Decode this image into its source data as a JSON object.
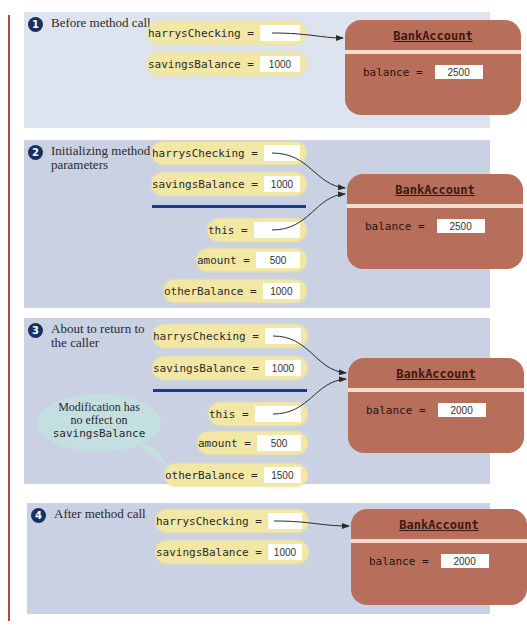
{
  "class_name": "BankAccount",
  "colors": {
    "panel_bg": "#c9d1e2",
    "panel1_bg": "#dde3ef",
    "variable_bg": "#f3e7a6",
    "object_bg": "#b76e5a",
    "divider": "#1a3a8a",
    "step_badge": "#17305f",
    "note_bubble": "#c4dfe0",
    "margin_rule": "#b5473e"
  },
  "steps": [
    {
      "number": "1",
      "caption": "Before method call",
      "variables": [
        {
          "name": "harrysChecking =",
          "value": ""
        },
        {
          "name": "savingsBalance =",
          "value": "1000"
        }
      ],
      "object": {
        "field": "balance =",
        "value": "2500"
      }
    },
    {
      "number": "2",
      "caption": "Initializing method parameters",
      "variables": [
        {
          "name": "harrysChecking =",
          "value": ""
        },
        {
          "name": "savingsBalance =",
          "value": "1000"
        }
      ],
      "parameters": [
        {
          "name": "this =",
          "value": ""
        },
        {
          "name": "amount =",
          "value": "500"
        },
        {
          "name": "otherBalance =",
          "value": "1000"
        }
      ],
      "object": {
        "field": "balance =",
        "value": "2500"
      }
    },
    {
      "number": "3",
      "caption": "About to return to the caller",
      "variables": [
        {
          "name": "harrysChecking =",
          "value": ""
        },
        {
          "name": "savingsBalance =",
          "value": "1000"
        }
      ],
      "parameters": [
        {
          "name": "this =",
          "value": ""
        },
        {
          "name": "amount =",
          "value": "500"
        },
        {
          "name": "otherBalance =",
          "value": "1500"
        }
      ],
      "object": {
        "field": "balance =",
        "value": "2000"
      },
      "note": {
        "line1": "Modification has",
        "line2": "no effect on",
        "code": "savingsBalance"
      }
    },
    {
      "number": "4",
      "caption": "After method call",
      "variables": [
        {
          "name": "harrysChecking =",
          "value": ""
        },
        {
          "name": "savingsBalance =",
          "value": "1000"
        }
      ],
      "object": {
        "field": "balance =",
        "value": "2000"
      }
    }
  ]
}
